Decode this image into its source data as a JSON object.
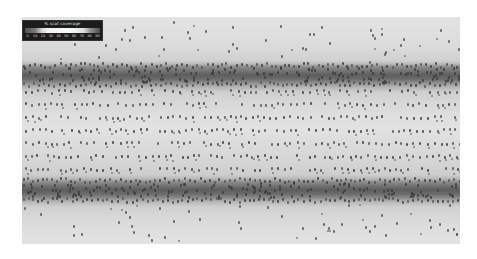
{
  "image": {
    "description": "Molecular simulation snapshot of a lipid bilayer / scaffold with coverage overlay",
    "colors": {
      "background": "#ffffff",
      "band_dark": "#5e5e5e",
      "solvent": "#dedede",
      "particles": "#555555"
    }
  },
  "legend": {
    "title": "% scaf coverage",
    "ticks": [
      "0",
      "10",
      "20",
      "30",
      "40",
      "50",
      "60",
      "70",
      "80",
      "90"
    ],
    "gradient_colors": [
      "#505050",
      "#cfcfcf",
      "#f8f8f8",
      "#e0e0e0",
      "#4e4e4e"
    ]
  }
}
